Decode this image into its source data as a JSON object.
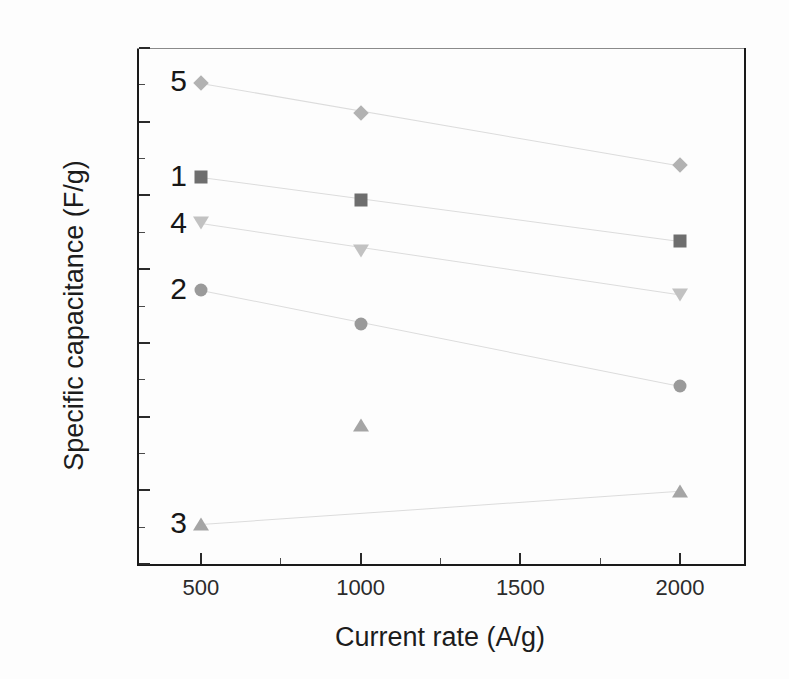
{
  "chart_data": {
    "type": "scatter",
    "title": "",
    "xlabel": "Current rate (A/g)",
    "ylabel": "Specific capacitance (F/g)",
    "x": [
      500,
      1000,
      2000
    ],
    "xlim": [
      300,
      2200
    ],
    "ylim": [
      80,
      150
    ],
    "xticks": [
      500,
      1000,
      1500,
      2000
    ],
    "yticks": [
      80,
      90,
      100,
      110,
      120,
      130,
      140,
      150
    ],
    "xtick_labels": [
      "500",
      "1000",
      "1500",
      "2000"
    ],
    "ytick_labels": [
      "80",
      "90",
      "100",
      "110",
      "120",
      "130",
      "140",
      "150"
    ],
    "grid": false,
    "legend_position": "inline-annotations",
    "series": [
      {
        "name": "1",
        "label": "1",
        "marker": "square",
        "color": "#6e6e6e",
        "values": [
          132.5,
          129.4,
          123.8
        ],
        "annotation": "1"
      },
      {
        "name": "2",
        "label": "2",
        "marker": "circle",
        "color": "#9a9a9a",
        "values": [
          117.2,
          112.5,
          104.2
        ],
        "annotation": "2"
      },
      {
        "name": "3",
        "label": "3",
        "marker": "triangle-up",
        "color": "#a5a5a5",
        "values": [
          85.4,
          98.8,
          89.9
        ],
        "annotation": "3"
      },
      {
        "name": "4",
        "label": "4",
        "marker": "triangle-down",
        "color": "#c2c2c2",
        "values": [
          126.2,
          122.4,
          116.5
        ],
        "annotation": "4"
      },
      {
        "name": "5",
        "label": "5",
        "marker": "diamond",
        "color": "#b2b2b2",
        "values": [
          145.3,
          141.2,
          134.1
        ],
        "annotation": "5"
      }
    ],
    "annotations": [
      {
        "text": "5",
        "x": 430,
        "y": 145.5
      },
      {
        "text": "1",
        "x": 430,
        "y": 132.6
      },
      {
        "text": "4",
        "x": 430,
        "y": 126.3
      },
      {
        "text": "2",
        "x": 430,
        "y": 117.3
      },
      {
        "text": "3",
        "x": 430,
        "y": 85.5
      }
    ]
  }
}
